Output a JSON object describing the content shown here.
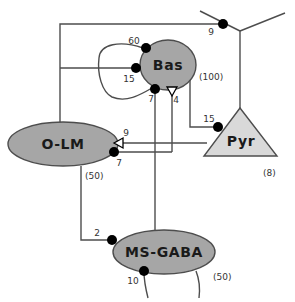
{
  "diagram": {
    "colors": {
      "cell_fill": "#a6a6a6",
      "pyramid_fill": "#d9d9d9",
      "stroke": "#4d4d4d",
      "synapse": "#000000",
      "text": "#1a1a1a"
    },
    "cells": [
      {
        "id": "bas",
        "label": "Bas",
        "count": "(100)",
        "shape": "ellipse"
      },
      {
        "id": "olm",
        "label": "O-LM",
        "count": "(50)",
        "shape": "ellipse"
      },
      {
        "id": "pyr",
        "label": "Pyr",
        "count": "(8)",
        "shape": "triangle"
      },
      {
        "id": "msgaba",
        "label": "MS-GABA",
        "count": "(50)",
        "shape": "ellipse"
      }
    ],
    "connections": [
      {
        "id": "bas-bas",
        "weight": "60",
        "marker": "filled-circle"
      },
      {
        "id": "olm-bas",
        "weight": "15",
        "marker": "filled-circle"
      },
      {
        "id": "msgaba-bas",
        "weight": "7",
        "marker": "filled-circle"
      },
      {
        "id": "pyr-bas",
        "weight": "4",
        "marker": "open-triangle"
      },
      {
        "id": "bas-pyr",
        "weight": "15",
        "marker": "filled-circle"
      },
      {
        "id": "pyr-olm",
        "weight": "9",
        "marker": "open-triangle"
      },
      {
        "id": "msgaba-olm",
        "weight": "7",
        "marker": "filled-circle"
      },
      {
        "id": "olm-msgaba",
        "weight": "2",
        "marker": "filled-circle"
      },
      {
        "id": "ext-msgaba",
        "weight": "10",
        "marker": "filled-circle"
      },
      {
        "id": "bas-pyr-apical",
        "weight": "9",
        "marker": "filled-circle"
      }
    ]
  }
}
